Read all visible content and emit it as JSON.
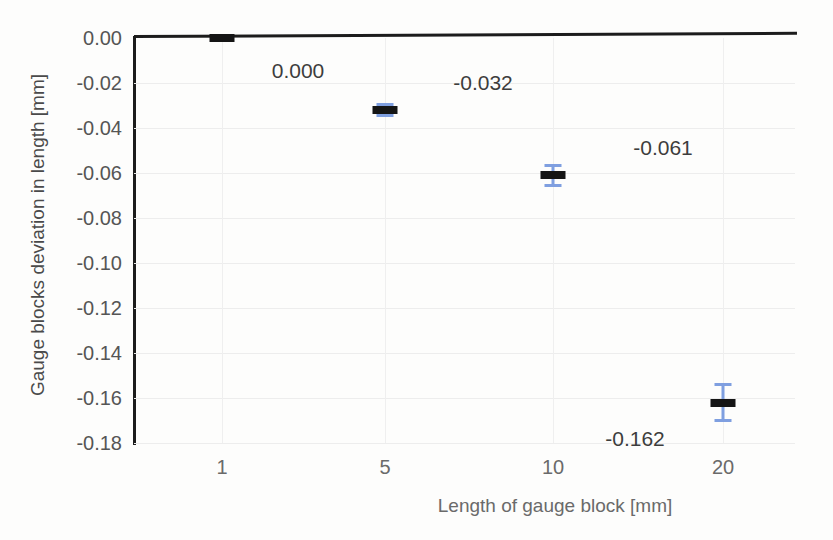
{
  "chart_data": {
    "type": "scatter",
    "title": "",
    "xlabel": "Length of gauge block [mm]",
    "ylabel": "Gauge blocks deviation in length [mm]",
    "categories": [
      "1",
      "5",
      "10",
      "20"
    ],
    "x": [
      1,
      5,
      10,
      20
    ],
    "values": [
      0.0,
      -0.032,
      -0.061,
      -0.162
    ],
    "data_labels": [
      "0.000",
      "-0.032",
      "-0.061",
      "-0.162"
    ],
    "error_bars": [
      0.0015,
      0.003,
      0.005,
      0.0085
    ],
    "ylim": [
      -0.18,
      0.0
    ],
    "ytick_labels": [
      "0.00",
      "-0.02",
      "-0.04",
      "-0.06",
      "-0.08",
      "-0.10",
      "-0.12",
      "-0.14",
      "-0.16",
      "-0.18"
    ],
    "ytick_values": [
      0.0,
      -0.02,
      -0.04,
      -0.06,
      -0.08,
      -0.1,
      -0.12,
      -0.14,
      -0.16,
      -0.18
    ],
    "xtick_labels": [
      "1",
      "5",
      "10",
      "20"
    ],
    "grid": true,
    "legend": "none",
    "marker_color": "#151515",
    "errorbar_color": "#7f9fe0",
    "axis_color": "#1c1c1c",
    "gridline_color": "#ededed",
    "background_color": "#fdfdfc"
  }
}
